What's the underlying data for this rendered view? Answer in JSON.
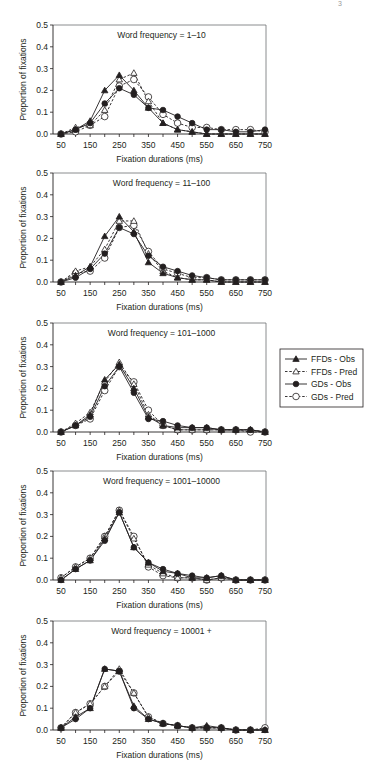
{
  "corner_mark": "3",
  "chart_data": [
    {
      "type": "line",
      "title": "Word frequency = 1–10",
      "xlabel": "Fixation durations (ms)",
      "ylabel": "Proportion of fixations",
      "x": [
        50,
        100,
        150,
        200,
        250,
        300,
        350,
        400,
        450,
        500,
        550,
        600,
        650,
        700,
        750
      ],
      "xticks": [
        50,
        150,
        250,
        350,
        450,
        550,
        650,
        750
      ],
      "yticks": [
        0.0,
        0.1,
        0.2,
        0.3,
        0.4,
        0.5
      ],
      "ylim": [
        0,
        0.5
      ],
      "grid": false,
      "series": [
        {
          "name": "FFDs - Obs",
          "values": [
            0.0,
            0.02,
            0.06,
            0.2,
            0.27,
            0.2,
            0.12,
            0.05,
            0.02,
            0.01,
            0.0,
            0.0,
            0.0,
            0.0,
            0.0
          ]
        },
        {
          "name": "FFDs - Pred",
          "values": [
            0.0,
            0.03,
            0.04,
            0.11,
            0.25,
            0.28,
            0.15,
            0.05,
            0.02,
            0.01,
            0.0,
            0.0,
            0.0,
            0.0,
            0.0
          ]
        },
        {
          "name": "GDs - Obs",
          "values": [
            0.0,
            0.02,
            0.05,
            0.14,
            0.21,
            0.18,
            0.12,
            0.11,
            0.08,
            0.05,
            0.02,
            0.02,
            0.01,
            0.01,
            0.02
          ]
        },
        {
          "name": "GDs - Pred",
          "values": [
            0.0,
            0.01,
            0.04,
            0.08,
            0.22,
            0.25,
            0.17,
            0.09,
            0.05,
            0.03,
            0.03,
            0.02,
            0.02,
            0.02,
            0.01
          ]
        }
      ]
    },
    {
      "type": "line",
      "title": "Word frequency = 11–100",
      "xlabel": "Fixation durations (ms)",
      "ylabel": "Proportion of fixations",
      "x": [
        50,
        100,
        150,
        200,
        250,
        300,
        350,
        400,
        450,
        500,
        550,
        600,
        650,
        700,
        750
      ],
      "xticks": [
        50,
        150,
        250,
        350,
        450,
        550,
        650,
        750
      ],
      "yticks": [
        0.0,
        0.1,
        0.2,
        0.3,
        0.4,
        0.5
      ],
      "ylim": [
        0,
        0.5
      ],
      "grid": false,
      "series": [
        {
          "name": "FFDs - Obs",
          "values": [
            0.0,
            0.03,
            0.07,
            0.21,
            0.3,
            0.23,
            0.09,
            0.04,
            0.02,
            0.01,
            0.01,
            0.0,
            0.0,
            0.0,
            0.0
          ]
        },
        {
          "name": "FFDs - Pred",
          "values": [
            0.0,
            0.05,
            0.07,
            0.15,
            0.28,
            0.28,
            0.13,
            0.05,
            0.02,
            0.01,
            0.01,
            0.0,
            0.0,
            0.0,
            0.0
          ]
        },
        {
          "name": "GDs - Obs",
          "values": [
            0.0,
            0.02,
            0.06,
            0.13,
            0.25,
            0.22,
            0.12,
            0.07,
            0.05,
            0.03,
            0.02,
            0.01,
            0.01,
            0.01,
            0.01
          ]
        },
        {
          "name": "GDs - Pred",
          "values": [
            0.0,
            0.04,
            0.05,
            0.11,
            0.25,
            0.26,
            0.14,
            0.06,
            0.04,
            0.02,
            0.02,
            0.01,
            0.01,
            0.01,
            0.01
          ]
        }
      ]
    },
    {
      "type": "line",
      "title": "Word frequency = 101–1000",
      "xlabel": "Fixation durations (ms)",
      "ylabel": "Proportion of fixations",
      "x": [
        50,
        100,
        150,
        200,
        250,
        300,
        350,
        400,
        450,
        500,
        550,
        600,
        650,
        700,
        750
      ],
      "xticks": [
        50,
        150,
        250,
        350,
        450,
        550,
        650,
        750
      ],
      "yticks": [
        0.0,
        0.1,
        0.2,
        0.3,
        0.4,
        0.5
      ],
      "ylim": [
        0,
        0.5
      ],
      "grid": false,
      "series": [
        {
          "name": "FFDs - Obs",
          "values": [
            0.0,
            0.03,
            0.08,
            0.24,
            0.31,
            0.2,
            0.07,
            0.03,
            0.02,
            0.02,
            0.02,
            0.01,
            0.01,
            0.01,
            0.0
          ]
        },
        {
          "name": "FFDs - Pred",
          "values": [
            0.0,
            0.04,
            0.09,
            0.23,
            0.32,
            0.22,
            0.08,
            0.03,
            0.01,
            0.01,
            0.01,
            0.01,
            0.01,
            0.01,
            0.0
          ]
        },
        {
          "name": "GDs - Obs",
          "values": [
            0.0,
            0.03,
            0.07,
            0.21,
            0.3,
            0.18,
            0.06,
            0.05,
            0.03,
            0.02,
            0.02,
            0.01,
            0.01,
            0.01,
            0.0
          ]
        },
        {
          "name": "GDs - Pred",
          "values": [
            0.0,
            0.03,
            0.06,
            0.19,
            0.3,
            0.23,
            0.1,
            0.03,
            0.01,
            0.01,
            0.01,
            0.01,
            0.01,
            0.0,
            0.0
          ]
        }
      ]
    },
    {
      "type": "line",
      "title": "Word frequency = 1001–10000",
      "xlabel": "Fixation durations (ms)",
      "ylabel": "Proportion of fixations",
      "x": [
        50,
        100,
        150,
        200,
        250,
        300,
        350,
        400,
        450,
        500,
        550,
        600,
        650,
        700,
        750
      ],
      "xticks": [
        50,
        150,
        250,
        350,
        450,
        550,
        650,
        750
      ],
      "yticks": [
        0.0,
        0.1,
        0.2,
        0.3,
        0.4,
        0.5
      ],
      "ylim": [
        0,
        0.5
      ],
      "grid": false,
      "series": [
        {
          "name": "FFDs - Obs",
          "values": [
            0.0,
            0.05,
            0.09,
            0.19,
            0.31,
            0.15,
            0.08,
            0.04,
            0.03,
            0.01,
            0.01,
            0.02,
            0.0,
            0.0,
            0.0
          ]
        },
        {
          "name": "FFDs - Pred",
          "values": [
            0.01,
            0.06,
            0.1,
            0.2,
            0.32,
            0.19,
            0.07,
            0.03,
            0.01,
            0.01,
            0.0,
            0.01,
            0.0,
            0.0,
            0.0
          ]
        },
        {
          "name": "GDs - Obs",
          "values": [
            0.0,
            0.05,
            0.09,
            0.18,
            0.31,
            0.15,
            0.08,
            0.05,
            0.03,
            0.02,
            0.01,
            0.02,
            0.0,
            0.0,
            0.0
          ]
        },
        {
          "name": "GDs - Pred",
          "values": [
            0.01,
            0.06,
            0.1,
            0.2,
            0.32,
            0.2,
            0.06,
            0.02,
            0.01,
            0.01,
            0.0,
            0.01,
            0.0,
            0.0,
            0.0
          ]
        }
      ]
    },
    {
      "type": "line",
      "title": "Word frequency = 10001 +",
      "xlabel": "Fixation durations (ms)",
      "ylabel": "Proportion of fixations",
      "x": [
        50,
        100,
        150,
        200,
        250,
        300,
        350,
        400,
        450,
        500,
        550,
        600,
        650,
        700,
        750
      ],
      "xticks": [
        50,
        150,
        250,
        350,
        450,
        550,
        650,
        750
      ],
      "yticks": [
        0.0,
        0.1,
        0.2,
        0.3,
        0.4,
        0.5
      ],
      "ylim": [
        0,
        0.5
      ],
      "grid": false,
      "series": [
        {
          "name": "FFDs - Obs",
          "values": [
            0.01,
            0.06,
            0.1,
            0.28,
            0.27,
            0.11,
            0.05,
            0.03,
            0.02,
            0.01,
            0.02,
            0.01,
            0.0,
            0.0,
            0.0
          ]
        },
        {
          "name": "FFDs - Pred",
          "values": [
            0.01,
            0.08,
            0.12,
            0.2,
            0.28,
            0.17,
            0.06,
            0.03,
            0.02,
            0.01,
            0.01,
            0.01,
            0.0,
            0.0,
            0.0
          ]
        },
        {
          "name": "GDs - Obs",
          "values": [
            0.01,
            0.05,
            0.1,
            0.28,
            0.27,
            0.1,
            0.05,
            0.03,
            0.02,
            0.01,
            0.01,
            0.01,
            0.0,
            0.0,
            0.0
          ]
        },
        {
          "name": "GDs - Pred",
          "values": [
            0.01,
            0.08,
            0.12,
            0.2,
            0.27,
            0.17,
            0.06,
            0.03,
            0.02,
            0.01,
            0.01,
            0.01,
            0.0,
            0.0,
            0.01
          ]
        }
      ]
    }
  ],
  "legend": {
    "position": "right",
    "entries": [
      {
        "label": "FFDs - Obs",
        "marker": "filled-triangle",
        "line": "solid"
      },
      {
        "label": "FFDs - Pred",
        "marker": "open-triangle",
        "line": "dashed"
      },
      {
        "label": "GDs - Obs",
        "marker": "filled-circle",
        "line": "solid"
      },
      {
        "label": "GDs - Pred",
        "marker": "open-circle",
        "line": "dashed"
      }
    ]
  },
  "colors": {
    "ink": "#231f20",
    "axis": "#6d6e71",
    "background": "#ffffff"
  }
}
